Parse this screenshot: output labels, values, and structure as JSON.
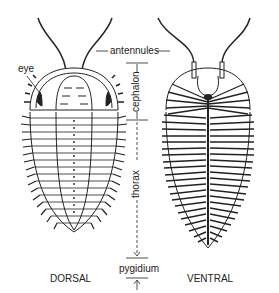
{
  "diagram": {
    "labels": {
      "eye": "eye",
      "antennules": "antennules",
      "cephalon": "cephalon",
      "thorax": "thorax",
      "pygidium": "pygidium"
    },
    "views": {
      "dorsal": "DORSAL",
      "ventral": "VENTRAL"
    },
    "colors": {
      "ink": "#222222",
      "background": "#ffffff"
    }
  }
}
